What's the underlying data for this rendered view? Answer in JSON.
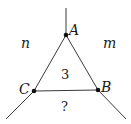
{
  "diagram": {
    "type": "graph-triangle",
    "vertices": [
      {
        "id": "A",
        "label": "A",
        "x": 66,
        "y": 35
      },
      {
        "id": "B",
        "label": "B",
        "x": 98,
        "y": 90
      },
      {
        "id": "C",
        "label": "C",
        "x": 34,
        "y": 91
      }
    ],
    "edges": [
      [
        "A",
        "B"
      ],
      [
        "B",
        "C"
      ],
      [
        "C",
        "A"
      ]
    ],
    "rays": [
      {
        "from": "A",
        "to": [
          66,
          8
        ]
      },
      {
        "from": "B",
        "to": [
          126,
          119
        ]
      },
      {
        "from": "C",
        "to": [
          6,
          119
        ]
      }
    ],
    "regions": {
      "left": "n",
      "right": "m",
      "inner": "3",
      "bottom": "?"
    },
    "stroke_color": "#333333",
    "point_color": "#111111"
  }
}
